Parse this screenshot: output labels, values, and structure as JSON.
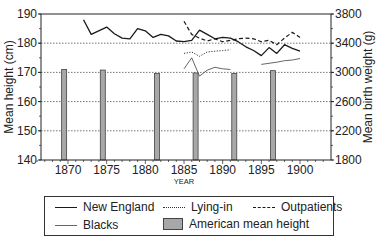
{
  "chart_data": {
    "type": "line",
    "title": "",
    "xlabel": "YEAR",
    "ylabel": "Mean height (cm)",
    "y2label": "Mean birth weight (g)",
    "xlim": [
      1866,
      1903
    ],
    "ylim": [
      140,
      190
    ],
    "y2lim": [
      1800,
      3800
    ],
    "x_ticks": [
      1870,
      1875,
      1880,
      1885,
      1890,
      1895,
      1900
    ],
    "y_ticks": [
      140,
      150,
      160,
      170,
      180,
      190
    ],
    "y2_ticks": [
      1800,
      2200,
      2600,
      3000,
      3400,
      3800
    ],
    "grid": "horizontal dotted",
    "legend_position": "bottom",
    "series": [
      {
        "name": "New England",
        "axis": "right",
        "style": "solid-dark",
        "x": [
          1872,
          1873,
          1875,
          1876,
          1877,
          1878,
          1879,
          1880,
          1881,
          1882,
          1883,
          1884,
          1885,
          1886,
          1887,
          1888,
          1889,
          1890,
          1891,
          1892,
          1893,
          1894,
          1895,
          1896,
          1897,
          1898,
          1899,
          1900
        ],
        "values": [
          3720,
          3520,
          3620,
          3530,
          3470,
          3460,
          3600,
          3570,
          3480,
          3520,
          3500,
          3430,
          3420,
          3440,
          3580,
          3520,
          3460,
          3480,
          3470,
          3420,
          3350,
          3300,
          3230,
          3340,
          3260,
          3380,
          3330,
          3290
        ]
      },
      {
        "name": "Lying-in",
        "axis": "right",
        "style": "dotted",
        "x": [
          1885,
          1886,
          1887,
          1888,
          1889,
          1890,
          1891
        ],
        "values": [
          3260,
          3280,
          3220,
          3280,
          3290,
          3300,
          3310
        ]
      },
      {
        "name": "Outpatients",
        "axis": "right",
        "style": "dashed",
        "x": [
          1885,
          1886,
          1887,
          1888,
          1889,
          1890,
          1891,
          1892,
          1893,
          1894,
          1895,
          1896,
          1897,
          1898,
          1899,
          1900
        ],
        "values": [
          3700,
          3520,
          3470,
          3430,
          3460,
          3420,
          3440,
          3460,
          3470,
          3460,
          3420,
          3440,
          3380,
          3470,
          3550,
          3480
        ]
      },
      {
        "name": "Blacks",
        "axis": "right",
        "style": "solid-light",
        "x": [
          1885,
          1886,
          1887,
          1888,
          1889,
          1890,
          1891,
          1895,
          1897,
          1898,
          1899,
          1900
        ],
        "values": [
          3050,
          3200,
          2950,
          3030,
          3070,
          3050,
          3040,
          3110,
          3140,
          3160,
          3170,
          3190
        ]
      },
      {
        "name": "American mean height",
        "axis": "left",
        "style": "bar",
        "x": [
          1869.5,
          1874.5,
          1881.5,
          1886.5,
          1891.5,
          1896.5
        ],
        "values": [
          171,
          170.8,
          169.6,
          169.8,
          169.6,
          170.6
        ]
      }
    ]
  },
  "axes": {
    "left_label": "Mean height (cm)",
    "right_label": "Mean birth weight (g)",
    "x_label": "YEAR",
    "left_ticks": [
      "190",
      "180",
      "170",
      "160",
      "150",
      "140"
    ],
    "right_ticks": [
      "3800",
      "3400",
      "3000",
      "2600",
      "2200",
      "1800"
    ],
    "x_ticks": [
      "1870",
      "1875",
      "1880",
      "1885",
      "1890",
      "1895",
      "1900"
    ]
  },
  "legend": {
    "new_england": "New England",
    "lying_in": "Lying-in",
    "outpatients": "Outpatients",
    "blacks": "Blacks",
    "american_mean_height": "American mean height"
  },
  "colors": {
    "dark_line": "#1a1a1a",
    "light_line": "#555555",
    "bar_fill": "#a8a8a8",
    "bar_stroke": "#444444",
    "grid": "#555555"
  }
}
